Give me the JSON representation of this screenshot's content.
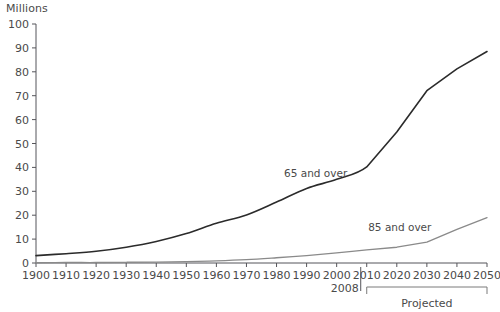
{
  "chart_data": {
    "type": "line",
    "title": "",
    "ylabel": "Millions",
    "xlabel": "",
    "ylim": [
      0,
      100
    ],
    "xlim": [
      1900,
      2050
    ],
    "grid": false,
    "legend_position": "inline-labels",
    "y_ticks": [
      "0",
      "10",
      "20",
      "30",
      "40",
      "50",
      "60",
      "70",
      "80",
      "90",
      "100"
    ],
    "y_tick_values": [
      0,
      10,
      20,
      30,
      40,
      50,
      60,
      70,
      80,
      90,
      100
    ],
    "x_ticks": [
      "1900",
      "1910",
      "1920",
      "1930",
      "1940",
      "1950",
      "1960",
      "1970",
      "1980",
      "1990",
      "2000",
      "2010",
      "2020",
      "2030",
      "2040",
      "2050"
    ],
    "x_tick_values": [
      1900,
      1910,
      1920,
      1930,
      1940,
      1950,
      1960,
      1970,
      1980,
      1990,
      2000,
      2010,
      2020,
      2030,
      2040,
      2050
    ],
    "x": [
      1900,
      1910,
      1920,
      1930,
      1940,
      1950,
      1960,
      1970,
      1980,
      1990,
      2000,
      2010,
      2020,
      2030,
      2040,
      2050
    ],
    "series": [
      {
        "name": "65 and over",
        "color": "#2b2b2b",
        "label_x": 1993,
        "label_y": 36,
        "values": [
          3.1,
          3.9,
          4.9,
          6.6,
          9.0,
          12.3,
          16.6,
          20.1,
          25.5,
          31.2,
          35.0,
          40.2,
          54.8,
          72.1,
          81.2,
          88.5
        ]
      },
      {
        "name": "85 and over",
        "color": "#8a8a8a",
        "label_x": 2021,
        "label_y": 13.5,
        "values": [
          0.1,
          0.2,
          0.2,
          0.3,
          0.4,
          0.6,
          0.9,
          1.4,
          2.2,
          3.1,
          4.2,
          5.5,
          6.6,
          8.7,
          14.1,
          19.0
        ]
      }
    ],
    "annotations": [
      {
        "name": "year-marker",
        "text": "2008",
        "x": 2008,
        "type": "vertical-marker"
      },
      {
        "name": "projected-bracket",
        "text": "Projected",
        "x_start": 2010,
        "x_end": 2050,
        "type": "bracket"
      }
    ]
  }
}
